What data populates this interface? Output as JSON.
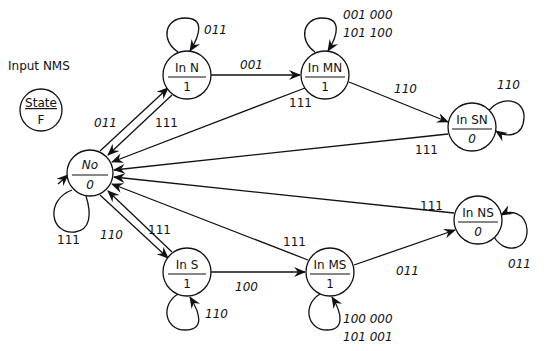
{
  "legend": {
    "input_label": "Input NMS",
    "state_label": "State",
    "output_label": "F"
  },
  "nodes": {
    "no": {
      "name": "No",
      "output": "0"
    },
    "in_n": {
      "name": "In N",
      "output": "1"
    },
    "in_mn": {
      "name": "In MN",
      "output": "1"
    },
    "in_sn": {
      "name": "In SN",
      "output": "0"
    },
    "in_s": {
      "name": "In S",
      "output": "1"
    },
    "in_ms": {
      "name": "In MS",
      "output": "1"
    },
    "in_ns": {
      "name": "In NS",
      "output": "0"
    }
  },
  "edges": {
    "no_self": "111",
    "no_to_in_n": "011",
    "in_n_to_no": "111",
    "in_n_self": "011",
    "in_n_to_in_mn": "001",
    "in_mn_self_1": "001  000",
    "in_mn_self_2": "101  100",
    "in_mn_to_no": "111",
    "in_mn_to_in_sn": "110",
    "in_sn_self": "110",
    "in_sn_to_no": "111",
    "no_to_in_s": "110",
    "in_s_to_no": "111",
    "in_s_self": "110",
    "in_s_to_in_ms": "100",
    "in_ms_to_no": "111",
    "in_ms_self_1": "100  000",
    "in_ms_self_2": "101  001",
    "in_ms_to_in_ns": "011",
    "in_ns_to_no": "111",
    "in_ns_self": "011"
  },
  "colors": {
    "stroke": "#111111",
    "background": "#ffffff"
  }
}
